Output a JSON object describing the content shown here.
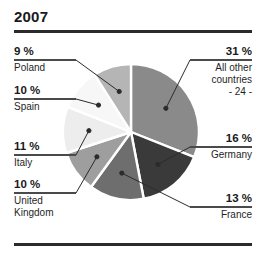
{
  "header": {
    "title": "2007"
  },
  "chart_data": {
    "type": "pie",
    "title": "2007",
    "xlabel": "",
    "ylabel": "",
    "legend_position": "callout-labels",
    "grid": false,
    "units": "%",
    "total": 100,
    "categories": [
      "All other countries - 24 -",
      "Germany",
      "France",
      "United Kingdom",
      "Italy",
      "Spain",
      "Poland"
    ],
    "values": [
      31,
      16,
      13,
      10,
      11,
      10,
      9
    ],
    "slices": [
      {
        "name_line1": "All other",
        "name_line2": "countries",
        "name_line3": "- 24 -",
        "percent_label": "31 %",
        "value": 31,
        "color": "#8a8a8a",
        "side": "right"
      },
      {
        "name_line1": "Germany",
        "name_line2": "",
        "name_line3": "",
        "percent_label": "16 %",
        "value": 16,
        "color": "#3a3a3a",
        "side": "right"
      },
      {
        "name_line1": "France",
        "name_line2": "",
        "name_line3": "",
        "percent_label": "13 %",
        "value": 13,
        "color": "#6e6e6e",
        "side": "right"
      },
      {
        "name_line1": "United",
        "name_line2": "Kingdom",
        "name_line3": "",
        "percent_label": "10 %",
        "value": 10,
        "color": "#9e9e9e",
        "side": "left"
      },
      {
        "name_line1": "Italy",
        "name_line2": "",
        "name_line3": "",
        "percent_label": "11 %",
        "value": 11,
        "color": "#ededed",
        "side": "left"
      },
      {
        "name_line1": "Spain",
        "name_line2": "",
        "name_line3": "",
        "percent_label": "10 %",
        "value": 10,
        "color": "#f7f7f7",
        "side": "left"
      },
      {
        "name_line1": "Poland",
        "name_line2": "",
        "name_line3": "",
        "percent_label": "9 %",
        "value": 9,
        "color": "#b5b5b5",
        "side": "left"
      }
    ]
  },
  "style": {
    "rule_color": "#2b2b2b",
    "leader_color": "#2b2b2b",
    "separator_color": "#ffffff",
    "text_color": "#1a1a1a"
  }
}
